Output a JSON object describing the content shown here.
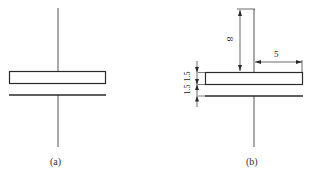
{
  "figure_a": {
    "caption": "(a)"
  },
  "figure_b": {
    "caption": "(b)",
    "dimensions": {
      "vertical_height": "8",
      "horizontal_width": "5",
      "plate_thickness": "1.5",
      "gap": "1.5"
    }
  },
  "colors": {
    "line": "#2a2a2a",
    "background": "#ffffff"
  }
}
